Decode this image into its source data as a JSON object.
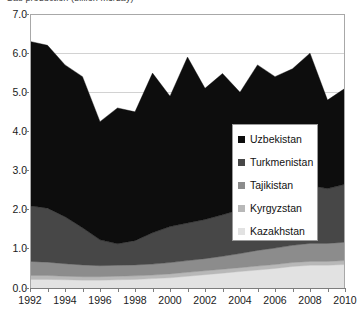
{
  "chart_title": "Gas production (billion m3/day)",
  "legend": {
    "position": "inside-right",
    "items": [
      {
        "label": "Uzbekistan",
        "color": "#0d0d0d"
      },
      {
        "label": "Turkmenistan",
        "color": "#474747"
      },
      {
        "label": "Tajikistan",
        "color": "#8c8c8c"
      },
      {
        "label": "Kyrgyzstan",
        "color": "#b8b8b8"
      },
      {
        "label": "Kazakhstan",
        "color": "#e2e2e2"
      }
    ]
  },
  "axes": {
    "y_ticks": [
      "0.0",
      "1.0",
      "2.0",
      "3.0",
      "4.0",
      "5.0",
      "6.0",
      "7.0"
    ],
    "x_ticks": [
      "1992",
      "1994",
      "1996",
      "1998",
      "2000",
      "2002",
      "2004",
      "2006",
      "2008",
      "2010"
    ]
  },
  "chart_data": {
    "type": "area",
    "stacked": true,
    "title": "Gas production (billion m3/day)",
    "xlabel": "",
    "ylabel": "",
    "xlim": [
      1992,
      2010
    ],
    "ylim": [
      0.0,
      7.0
    ],
    "ytick_step": 1.0,
    "grid": true,
    "legend_position": "inside-right",
    "x": [
      1992,
      1993,
      1994,
      1995,
      1996,
      1997,
      1998,
      1999,
      2000,
      2001,
      2002,
      2003,
      2004,
      2005,
      2006,
      2007,
      2008,
      2009,
      2010
    ],
    "series": [
      {
        "name": "Kazakhstan",
        "color": "#e2e2e2",
        "values": [
          0.22,
          0.22,
          0.21,
          0.2,
          0.2,
          0.21,
          0.22,
          0.24,
          0.26,
          0.3,
          0.34,
          0.38,
          0.42,
          0.46,
          0.5,
          0.55,
          0.58,
          0.58,
          0.6
        ]
      },
      {
        "name": "Kyrgyzstan",
        "color": "#b8b8b8",
        "values": [
          0.1,
          0.1,
          0.09,
          0.09,
          0.09,
          0.09,
          0.09,
          0.09,
          0.1,
          0.1,
          0.1,
          0.1,
          0.1,
          0.1,
          0.1,
          0.1,
          0.1,
          0.1,
          0.1
        ]
      },
      {
        "name": "Tajikistan",
        "color": "#8c8c8c",
        "values": [
          0.36,
          0.34,
          0.32,
          0.3,
          0.28,
          0.28,
          0.28,
          0.28,
          0.29,
          0.3,
          0.31,
          0.33,
          0.36,
          0.4,
          0.42,
          0.44,
          0.46,
          0.46,
          0.47
        ]
      },
      {
        "name": "Turkmenistan",
        "color": "#474747",
        "values": [
          1.42,
          1.38,
          1.2,
          0.95,
          0.66,
          0.55,
          0.62,
          0.8,
          0.92,
          0.96,
          1.0,
          1.06,
          1.12,
          1.2,
          1.3,
          1.4,
          1.48,
          1.4,
          1.48
        ]
      },
      {
        "name": "Uzbekistan",
        "color": "#0d0d0d",
        "values": [
          4.2,
          4.16,
          3.88,
          3.86,
          3.02,
          3.47,
          3.29,
          4.08,
          3.33,
          4.24,
          3.35,
          3.61,
          3.0,
          3.54,
          3.08,
          3.11,
          3.38,
          2.26,
          2.45
        ]
      }
    ],
    "totals": [
      6.3,
      6.2,
      5.7,
      5.4,
      4.25,
      4.6,
      4.5,
      5.49,
      4.9,
      5.9,
      5.1,
      5.48,
      5.0,
      5.7,
      5.4,
      5.6,
      6.0,
      4.8,
      5.1
    ]
  }
}
